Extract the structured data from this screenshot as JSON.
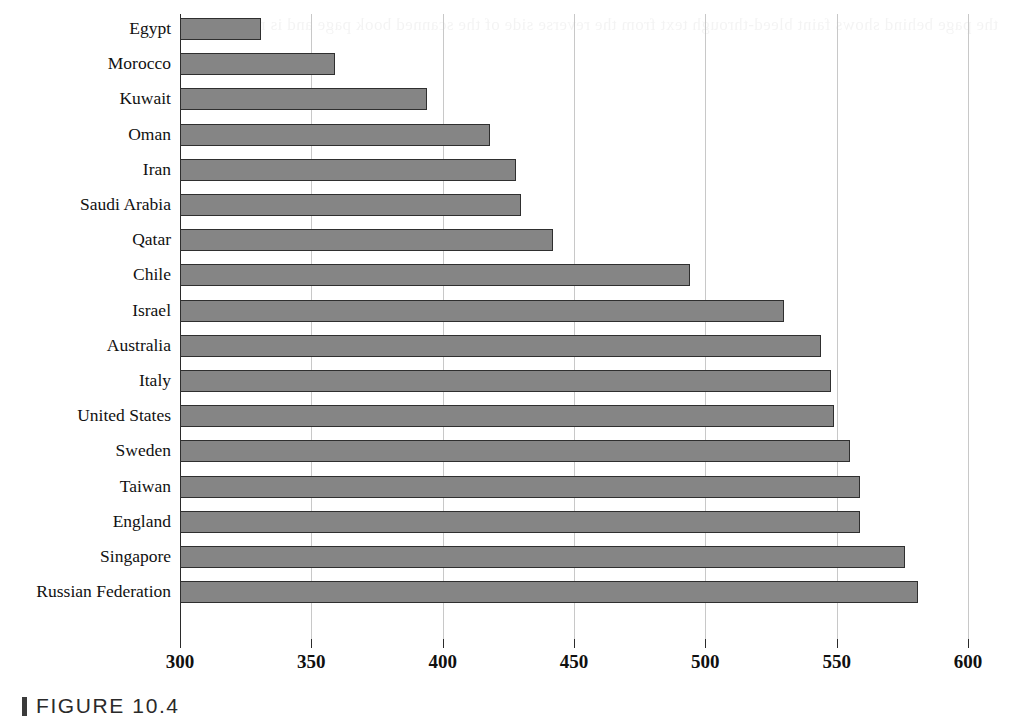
{
  "caption": {
    "marker": "caption-bar",
    "text": "FIGURE 10.4"
  },
  "background_ghost_text": "the page behind shows faint bleed-through text from the reverse side of the scanned book page and is not legible",
  "chart_data": {
    "type": "bar",
    "orientation": "horizontal",
    "title": "",
    "subtitle": "",
    "xlabel": "",
    "ylabel": "",
    "xlim": [
      300,
      600
    ],
    "ylim": null,
    "grid": "vertical",
    "legend": "none",
    "bar_color": "#858585",
    "bar_border_color": "#2f2f2f",
    "gridline_color": "#c8c8c8",
    "axis_color": "#2b2b2b",
    "xticks": [
      300,
      350,
      400,
      450,
      500,
      550,
      600
    ],
    "xtick_labels": [
      "300",
      "350",
      "400",
      "450",
      "500",
      "550",
      "600"
    ],
    "categories": [
      "Egypt",
      "Morocco",
      "Kuwait",
      "Oman",
      "Iran",
      "Saudi Arabia",
      "Qatar",
      "Chile",
      "Israel",
      "Australia",
      "Italy",
      "United States",
      "Sweden",
      "Taiwan",
      "England",
      "Singapore",
      "Russian Federation"
    ],
    "values": [
      331,
      359,
      394,
      418,
      428,
      430,
      442,
      494,
      530,
      544,
      548,
      549,
      555,
      559,
      559,
      576,
      581
    ]
  }
}
